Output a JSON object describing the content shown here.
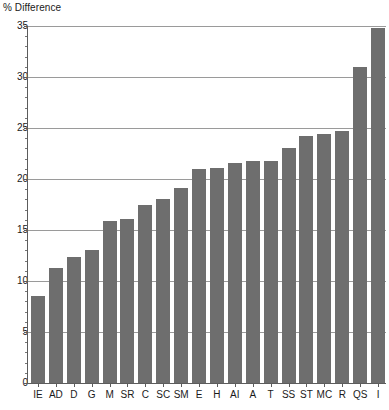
{
  "chart_data": {
    "type": "bar",
    "title": "",
    "ylabel": "% Difference",
    "xlabel": "",
    "ylim": [
      0,
      35
    ],
    "ytick_step": 5,
    "yticks": [
      "0",
      "5",
      "10",
      "15",
      "20",
      "25",
      "30",
      "35"
    ],
    "grid": true,
    "grid_axis": "y",
    "legend": "none",
    "bar_color": "#6e6e6e",
    "axis_color": "#5c5c5c",
    "grid_color": "#9a9a9a",
    "categories": [
      "IE",
      "AD",
      "D",
      "G",
      "M",
      "SR",
      "C",
      "SC",
      "SM",
      "E",
      "H",
      "AI",
      "A",
      "T",
      "SS",
      "ST",
      "MC",
      "R",
      "QS",
      "I"
    ],
    "values": [
      8.5,
      11.3,
      12.4,
      13.0,
      15.9,
      16.1,
      17.5,
      18.0,
      19.1,
      21.0,
      21.1,
      21.6,
      21.8,
      21.8,
      23.0,
      24.2,
      24.4,
      24.7,
      31.0,
      34.8
    ]
  }
}
